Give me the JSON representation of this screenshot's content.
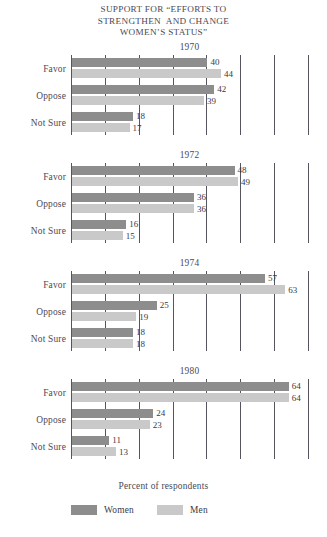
{
  "chart_data": {
    "type": "bar",
    "title_lines": [
      "SUPPORT FOR “EFFORTS TO",
      "STRENGTHEN  AND CHANGE",
      "WOMEN’S STATUS”"
    ],
    "orientation": "horizontal",
    "xlabel": "Percent of respondents",
    "ylabel": "",
    "xlim": [
      0,
      70
    ],
    "xtick_step": 10,
    "grid": true,
    "gridlines_at": [
      10,
      20,
      30,
      40,
      50,
      60,
      70
    ],
    "xtick_labels_shown": false,
    "legend_position": "bottom",
    "categories": [
      "Favor",
      "Oppose",
      "Not Sure"
    ],
    "series_names": [
      "Women",
      "Men"
    ],
    "colors": {
      "women": "#8d8d8d",
      "men": "#c9c9c9",
      "axis": "#55555f",
      "text": "#3a3a44"
    },
    "panels": [
      {
        "year": "1970",
        "series": [
          {
            "name": "Women",
            "values": [
              40,
              42,
              18
            ]
          },
          {
            "name": "Men",
            "values": [
              44,
              39,
              17
            ]
          }
        ],
        "value_labels": {
          "women": [
            "40",
            "42",
            "18"
          ],
          "men": [
            "44",
            "39",
            "17"
          ]
        }
      },
      {
        "year": "1972",
        "series": [
          {
            "name": "Women",
            "values": [
              48,
              36,
              16
            ]
          },
          {
            "name": "Men",
            "values": [
              49,
              36,
              15
            ]
          }
        ],
        "value_labels": {
          "women": [
            "48",
            "36",
            "16"
          ],
          "men": [
            "49",
            "36",
            "15"
          ]
        }
      },
      {
        "year": "1974",
        "series": [
          {
            "name": "Women",
            "values": [
              57,
              25,
              18
            ]
          },
          {
            "name": "Men",
            "values": [
              63,
              19,
              18
            ]
          }
        ],
        "value_labels": {
          "women": [
            "57",
            "25",
            "18"
          ],
          "men": [
            "63",
            "19",
            "18"
          ]
        }
      },
      {
        "year": "1980",
        "series": [
          {
            "name": "Women",
            "values": [
              64,
              24,
              11
            ]
          },
          {
            "name": "Men",
            "values": [
              64,
              23,
              13
            ]
          }
        ],
        "value_labels": {
          "women": [
            "64",
            "24",
            "11"
          ],
          "men": [
            "64",
            "23",
            "13"
          ]
        }
      }
    ]
  },
  "legend": {
    "items": [
      {
        "label": "Women",
        "color": "#8d8d8d"
      },
      {
        "label": "Men",
        "color": "#c9c9c9"
      }
    ]
  }
}
